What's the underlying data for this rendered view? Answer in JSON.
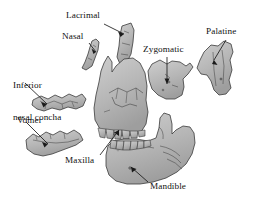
{
  "figure": {
    "type": "anatomical-diagram",
    "background_color": "#ffffff",
    "bone_fill_color": "#b9b9b9",
    "bone_outline_color": "#3a3a3a",
    "label_color": "#111111",
    "leader_line_color": "#1a1a1a"
  },
  "labels": [
    {
      "id": "lacrimal",
      "text": "Lacrimal",
      "lines": [
        "Lacrimal"
      ]
    },
    {
      "id": "nasal",
      "text": "Nasal",
      "lines": [
        "Nasal"
      ]
    },
    {
      "id": "zygomatic",
      "text": "Zygomatic",
      "lines": [
        "Zygomatic"
      ]
    },
    {
      "id": "palatine",
      "text": "Palatine",
      "lines": [
        "Palatine"
      ]
    },
    {
      "id": "inferior-nasal-concha",
      "text": "Inferior nasal concha",
      "lines": [
        "Inferior",
        "nasal concha"
      ]
    },
    {
      "id": "vomer",
      "text": "Vomer",
      "lines": [
        "Vomer"
      ]
    },
    {
      "id": "maxilla",
      "text": "Maxilla",
      "lines": [
        "Maxilla"
      ]
    },
    {
      "id": "mandible",
      "text": "Mandible",
      "lines": [
        "Mandible"
      ]
    }
  ],
  "label_lines": {
    "lacrimal": "Lacrimal",
    "nasal": "Nasal",
    "zygomatic": "Zygomatic",
    "palatine": "Palatine",
    "inferior_nasal_concha_1": "Inferior",
    "inferior_nasal_concha_2": "nasal concha",
    "vomer": "Vomer",
    "maxilla": "Maxilla",
    "mandible": "Mandible"
  }
}
